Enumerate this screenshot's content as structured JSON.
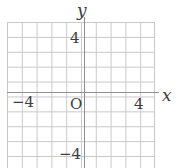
{
  "figure": {
    "type": "coordinate-grid",
    "title": "",
    "background_color": "#ffffff",
    "grid_color": "#c9c9cd",
    "axis_color": "#8e8e95",
    "text_color": "#3d3d42"
  },
  "axes": {
    "x": {
      "name": "x",
      "labels": [
        {
          "key": "neg4",
          "text": "−4",
          "value": -4
        },
        {
          "key": "pos4",
          "text": "4",
          "value": 4
        }
      ]
    },
    "y": {
      "name": "y",
      "labels": [
        {
          "key": "pos4",
          "text": "4",
          "value": 4
        },
        {
          "key": "neg4",
          "text": "−4",
          "value": -4
        }
      ]
    },
    "origin": {
      "text": "O",
      "value": 0
    }
  },
  "chart_data": {
    "type": "scatter",
    "title": "",
    "xlabel": "x",
    "ylabel": "y",
    "xlim": [
      -5,
      5
    ],
    "ylim": [
      -5,
      5
    ],
    "xticks": [
      -4,
      4
    ],
    "xticklabels": [
      "−4",
      "4"
    ],
    "yticks": [
      4,
      -4
    ],
    "yticklabels": [
      "4",
      "−4"
    ],
    "origin_label": "O",
    "grid": true,
    "grid_step": 1,
    "legend": null,
    "series": [],
    "annotations": []
  }
}
